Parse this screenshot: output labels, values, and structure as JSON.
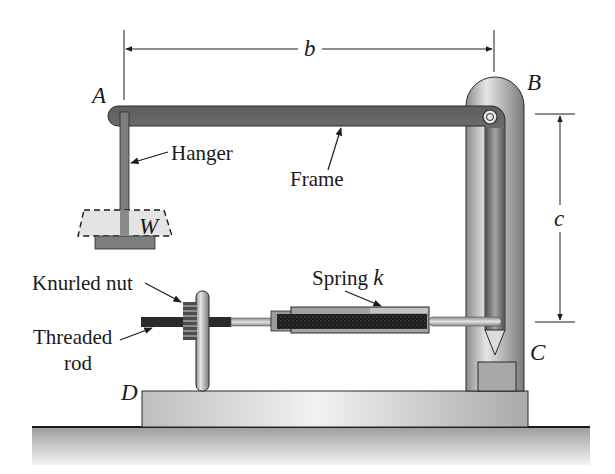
{
  "figure": {
    "type": "mechanical-apparatus-diagram",
    "points": {
      "A": "A",
      "B": "B",
      "C": "C",
      "D": "D"
    },
    "dimensions": {
      "b": "b",
      "c": "c"
    },
    "weight_label": "W",
    "labels": {
      "hanger": "Hanger",
      "frame": "Frame",
      "knurled_nut": "Knurled nut",
      "spring": "Spring ",
      "spring_symbol": "k",
      "threaded_rod_line1": "Threaded",
      "threaded_rod_line2": "rod"
    },
    "colors": {
      "frame_dark": "#5a5a5a",
      "frame_light": "#bdbdbd",
      "post": "#9a9a9a",
      "spring_coil": "#1e1e1e",
      "ground": "#c8c8c8",
      "base": "#d2d2d2",
      "weight_fill": "#e4e4e4"
    }
  }
}
